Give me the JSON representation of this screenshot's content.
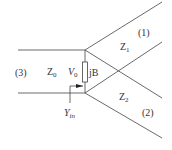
{
  "diagram": {
    "type": "transmission-line T-junction",
    "ports": [
      {
        "id": "port-3",
        "label": "(3)"
      },
      {
        "id": "port-1",
        "label": "(1)"
      },
      {
        "id": "port-2",
        "label": "(2)"
      }
    ],
    "impedances": {
      "z0": {
        "base": "Z",
        "sub": "0"
      },
      "z1": {
        "base": "Z",
        "sub": "1"
      },
      "z2": {
        "base": "Z",
        "sub": "2"
      }
    },
    "voltage": {
      "base": "V",
      "sub": "0"
    },
    "susceptance": {
      "label": "jB"
    },
    "input_admittance": {
      "base": "Y",
      "sub": "in"
    },
    "colors": {
      "line": "#444444",
      "text": "#333333"
    }
  }
}
